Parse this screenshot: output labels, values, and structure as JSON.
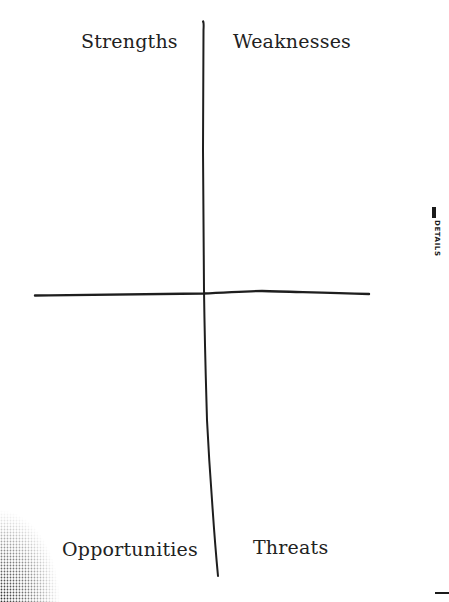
{
  "diagram": {
    "type": "SWOT quadrant",
    "quadrants": [
      {
        "id": "strengths",
        "label": "Strengths",
        "position": "top-left"
      },
      {
        "id": "weaknesses",
        "label": "Weaknesses",
        "position": "top-right"
      },
      {
        "id": "opportunities",
        "label": "Opportunities",
        "position": "bottom-left"
      },
      {
        "id": "threats",
        "label": "Threats",
        "position": "bottom-right"
      }
    ],
    "axes": {
      "vertical": {
        "points": [
          [
            203,
            22
          ],
          [
            203,
            150
          ],
          [
            204,
            290
          ],
          [
            207,
            420
          ],
          [
            212,
            500
          ],
          [
            218,
            576
          ]
        ]
      },
      "horizontal": {
        "points": [
          [
            35,
            295
          ],
          [
            120,
            294
          ],
          [
            203,
            293
          ],
          [
            260,
            291
          ],
          [
            320,
            293
          ],
          [
            369,
            294
          ]
        ]
      }
    },
    "line_color": "#1e1e1e",
    "label_color": "#222222"
  },
  "side_panel": {
    "tab_label": "DETAILS",
    "accent_color": "#1a1a1a"
  }
}
